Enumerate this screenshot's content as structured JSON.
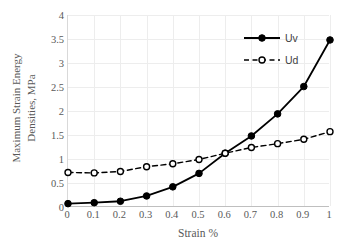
{
  "chart_data": {
    "type": "line",
    "title": "",
    "xlabel": "Strain %",
    "ylabel": "Maximum Strain Energy Densities, MPa",
    "ylabel_line1": "Maximum Strain Energy",
    "ylabel_line2": "Densities, MPa",
    "x": [
      0,
      0.1,
      0.2,
      0.3,
      0.4,
      0.5,
      0.6,
      0.7,
      0.8,
      0.9,
      1
    ],
    "xtick_labels": [
      "0",
      "0.1",
      "0.2",
      "0.3",
      "0.4",
      "0.5",
      "0.6",
      "0.7",
      "0.8",
      "0.9",
      "1"
    ],
    "ytick_labels": [
      "0",
      "0.5",
      "1",
      "1.5",
      "2",
      "2.5",
      "3",
      "3.5",
      "4"
    ],
    "yticks": [
      0,
      0.5,
      1,
      1.5,
      2,
      2.5,
      3,
      3.5,
      4
    ],
    "xlim": [
      0,
      1
    ],
    "ylim": [
      0,
      4
    ],
    "grid": true,
    "legend_position": "top-right",
    "series": [
      {
        "name": "Uv",
        "values": [
          0.07,
          0.09,
          0.12,
          0.23,
          0.42,
          0.7,
          1.12,
          1.48,
          1.94,
          2.51,
          3.48
        ],
        "line_style": "solid",
        "marker": "filled-circle",
        "color": "#000000"
      },
      {
        "name": "Ud",
        "values": [
          0.72,
          0.71,
          0.74,
          0.84,
          0.9,
          0.99,
          1.12,
          1.24,
          1.32,
          1.41,
          1.57
        ],
        "line_style": "dashed",
        "marker": "open-circle",
        "color": "#000000"
      }
    ]
  },
  "colors": {
    "series": "#000000",
    "gridline": "#ededed",
    "axis": "#bfbfbf",
    "tick_text": "#595959",
    "legend_text": "#3f3f3f",
    "background": "#ffffff"
  }
}
